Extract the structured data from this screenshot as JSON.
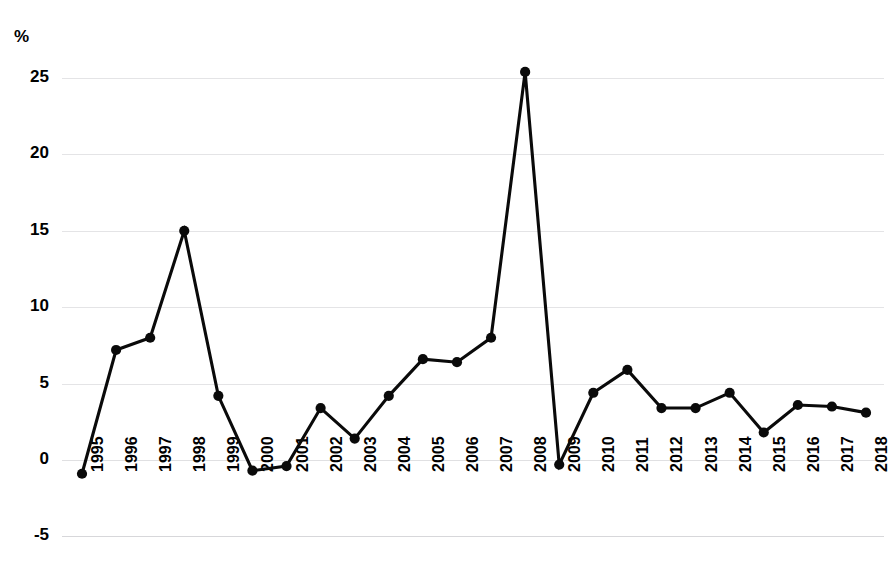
{
  "chart_data": {
    "type": "line",
    "title": "",
    "subtitle": "",
    "xlabel": "",
    "ylabel": "%",
    "axis_unit_label": "%",
    "categories": [
      "1995",
      "1996",
      "1997",
      "1998",
      "1999",
      "2000",
      "2001",
      "2002",
      "2003",
      "2004",
      "2005",
      "2006",
      "2007",
      "2008",
      "2009",
      "2010",
      "2011",
      "2012",
      "2013",
      "2014",
      "2015",
      "2016",
      "2017",
      "2018"
    ],
    "values": [
      -0.9,
      7.2,
      8.0,
      15.0,
      4.2,
      -0.7,
      -0.4,
      3.4,
      1.4,
      4.2,
      6.6,
      6.4,
      8.0,
      25.4,
      -0.3,
      4.4,
      5.9,
      3.4,
      3.4,
      4.4,
      1.8,
      3.6,
      3.5,
      3.1
    ],
    "series": [
      {
        "name": "",
        "values": [
          -0.9,
          7.2,
          8.0,
          15.0,
          4.2,
          -0.7,
          -0.4,
          3.4,
          1.4,
          4.2,
          6.6,
          6.4,
          8.0,
          25.4,
          -0.3,
          4.4,
          5.9,
          3.4,
          3.4,
          4.4,
          1.8,
          3.6,
          3.5,
          3.1
        ],
        "color": "#0a0a0a",
        "marker": "circle"
      }
    ],
    "y_ticks": [
      -5,
      0,
      5,
      10,
      15,
      20,
      25
    ],
    "y_tick_labels": [
      "-5",
      "0",
      "5",
      "10",
      "15",
      "20",
      "25"
    ],
    "ylim": [
      -5,
      27
    ],
    "grid": true,
    "grid_color": "#e4e4e6",
    "legend": "none",
    "legend_position": "none",
    "annotations": []
  },
  "colors": {
    "line": "#0a0a0a",
    "marker": "#0a0a0a",
    "grid": "#e4e4e6",
    "background": "#ffffff",
    "text": "#000000"
  }
}
